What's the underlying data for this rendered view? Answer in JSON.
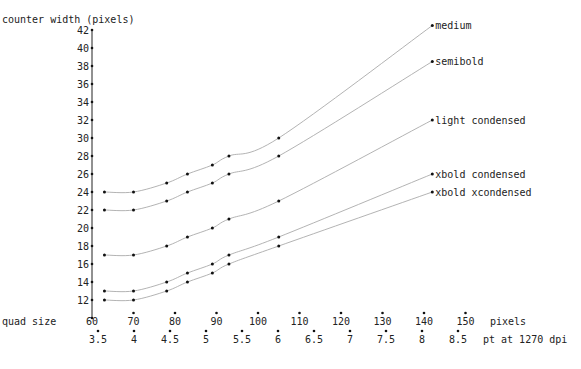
{
  "chart_data": {
    "type": "line",
    "title": "",
    "ylabel": "counter width (pixels)",
    "xlabel": "quad size",
    "x_unit_label": "pixels",
    "x2_unit_label": "pt at 1270 dpi",
    "ylim": [
      10,
      42
    ],
    "xlim": [
      60,
      150
    ],
    "grid": false,
    "legend_position": "inline-right",
    "y_ticks": [
      12,
      14,
      16,
      18,
      20,
      22,
      24,
      26,
      28,
      30,
      32,
      34,
      36,
      38,
      40,
      42
    ],
    "x_ticks": [
      60,
      70,
      80,
      90,
      100,
      110,
      120,
      130,
      140,
      150
    ],
    "x2_ticks": [
      "3.5",
      "4",
      "4.5",
      "5",
      "5.5",
      "6",
      "6.5",
      "7",
      "7.5",
      "8",
      "8.5"
    ],
    "x": [
      63,
      70,
      78,
      83,
      89,
      93,
      105,
      142
    ],
    "series": [
      {
        "name": "medium",
        "values": [
          24,
          24,
          25,
          26,
          27,
          28,
          30,
          42.5
        ]
      },
      {
        "name": "semibold",
        "values": [
          22,
          22,
          23,
          24,
          25,
          26,
          28,
          38.5
        ]
      },
      {
        "name": "light condensed",
        "values": [
          17,
          17,
          18,
          19,
          20,
          21,
          23,
          32
        ]
      },
      {
        "name": "xbold condensed",
        "values": [
          13,
          13,
          14,
          15,
          16,
          17,
          19,
          26
        ]
      },
      {
        "name": "xbold xcondensed",
        "values": [
          12,
          12,
          13,
          14,
          15,
          16,
          18,
          24
        ]
      }
    ]
  }
}
